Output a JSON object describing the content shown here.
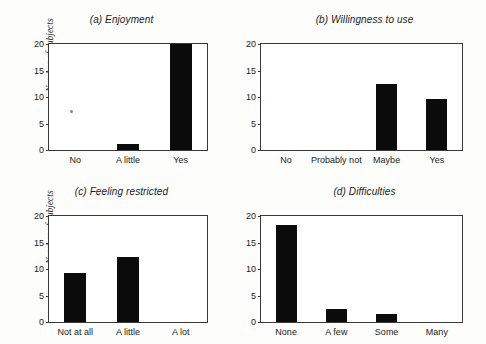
{
  "figure": {
    "background_color": "#fdfdfc",
    "bar_color": "#0b0b0b",
    "axis_color": "#3a3a3a",
    "text_color": "#1b1b1b",
    "ylabel": "Number of subjects",
    "artifact_label": "scan-speck"
  },
  "chart_data": [
    {
      "type": "bar",
      "title": "(a) Enjoyment",
      "xlabel": "",
      "ylabel": "Number of subjects",
      "categories": [
        "No",
        "A little",
        "Yes"
      ],
      "values": [
        0,
        1.2,
        20
      ],
      "ylim": [
        0,
        20
      ],
      "yticks": [
        0,
        5,
        10,
        15,
        20
      ],
      "ytick_labels": [
        "0",
        "5",
        "10",
        "15",
        "20"
      ],
      "grid": false,
      "legend": "none"
    },
    {
      "type": "bar",
      "title": "(b) Willingness to use",
      "xlabel": "",
      "ylabel": "",
      "categories": [
        "No",
        "Probably not",
        "Maybe",
        "Yes"
      ],
      "values": [
        0,
        0,
        12.4,
        9.7
      ],
      "ylim": [
        0,
        20
      ],
      "yticks": [
        0,
        5,
        10,
        15,
        20
      ],
      "ytick_labels": [
        "0",
        "5",
        "10",
        "15",
        "20"
      ],
      "grid": false,
      "legend": "none"
    },
    {
      "type": "bar",
      "title": "(c) Feeling restricted",
      "xlabel": "",
      "ylabel": "Number of subjects",
      "categories": [
        "Not at all",
        "A little",
        "A lot"
      ],
      "values": [
        9.3,
        12.3,
        0
      ],
      "ylim": [
        0,
        20
      ],
      "yticks": [
        0,
        5,
        10,
        15,
        20
      ],
      "ytick_labels": [
        "0",
        "5",
        "10",
        "15",
        "20"
      ],
      "grid": false,
      "legend": "none"
    },
    {
      "type": "bar",
      "title": "(d) Difficulties",
      "xlabel": "",
      "ylabel": "",
      "categories": [
        "None",
        "A few",
        "Some",
        "Many"
      ],
      "values": [
        18.3,
        2.5,
        1.5,
        0
      ],
      "ylim": [
        0,
        20
      ],
      "yticks": [
        0,
        5,
        10,
        15,
        20
      ],
      "ytick_labels": [
        "0",
        "5",
        "10",
        "15",
        "20"
      ],
      "grid": false,
      "legend": "none"
    }
  ]
}
